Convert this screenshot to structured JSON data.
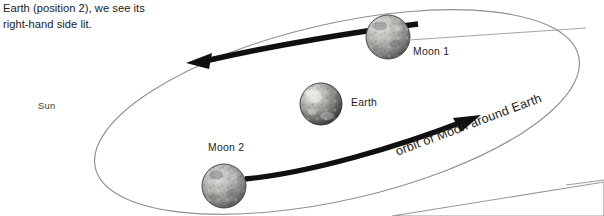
{
  "figure": {
    "kind": "astronomy-diagram",
    "caption_line1": "Earth (position 2), we see its",
    "caption_line2": "right-hand side lit.",
    "background": "#ffffff",
    "ink": "#1d1d1d",
    "orbit_stroke": "#8f8f8f",
    "arrow_fill": "#111111",
    "wedge_stroke": "#9a9a9a"
  },
  "labels": {
    "sun": "Sun",
    "earth": "Earth",
    "moon1": "Moon 1",
    "moon2": "Moon 2",
    "orbit": "orbit of Moon around Earth"
  },
  "bodies": [
    {
      "name": "Moon 1",
      "cx": 388,
      "cy": 37,
      "r": 22,
      "lit_from": "upper-left"
    },
    {
      "name": "Earth",
      "cx": 321,
      "cy": 104,
      "r": 21,
      "lit_from": "upper-left"
    },
    {
      "name": "Moon 2",
      "cx": 224,
      "cy": 186,
      "r": 22,
      "lit_from": "upper-left"
    }
  ],
  "orbit": {
    "shape": "ellipse",
    "cx": 337,
    "cy": 112,
    "rx": 248,
    "ry": 88,
    "rotation_deg": -13
  },
  "arrows": [
    {
      "name": "back-arc-arrow",
      "direction": "leftward",
      "tip_x": 186,
      "tip_y": 63
    },
    {
      "name": "front-arc-arrow",
      "direction": "rightward",
      "tip_x": 481,
      "tip_y": 116
    }
  ],
  "footer_shape": {
    "name": "figure-edge-wedge",
    "description": "thin grey outlined wedge at bottom right, edge of the next figure"
  }
}
